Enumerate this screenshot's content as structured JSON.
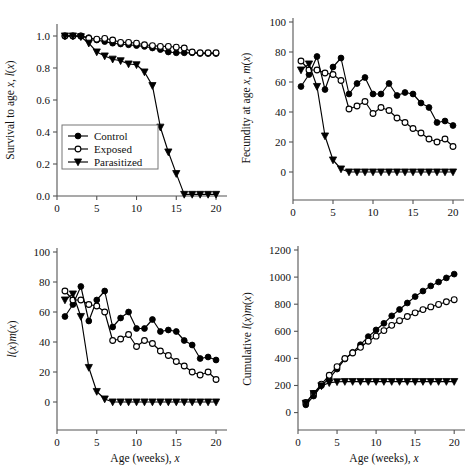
{
  "figure": {
    "background": "#ffffff",
    "line_color": "#000000",
    "marker_fill_control": "#000000",
    "marker_fill_exposed": "#ffffff",
    "marker_fill_parasitized": "#000000",
    "axis_color": "#555555"
  },
  "legend": {
    "position": "top-left panel, lower-left inside axes",
    "entries": [
      {
        "label": "Control",
        "marker": "filled-circle"
      },
      {
        "label": "Exposed",
        "marker": "open-circle"
      },
      {
        "label": "Parasitized",
        "marker": "filled-triangle-down"
      }
    ]
  },
  "chart_data": [
    {
      "id": "panel-survival",
      "type": "line",
      "title": "",
      "xlabel": "",
      "ylabel": "Survival to age x, l(x)",
      "xlim": [
        0,
        21
      ],
      "ylim": [
        0,
        1.05
      ],
      "xticks": [
        0,
        5,
        10,
        15,
        20
      ],
      "yticks": [
        0.0,
        0.2,
        0.4,
        0.6,
        0.8,
        1.0
      ],
      "ytick_labels": [
        "0.0",
        "0.2",
        "0.4",
        "0.6",
        "0.8",
        "1.0"
      ],
      "xtick_labels": [
        "0",
        "5",
        "10",
        "15",
        "20"
      ],
      "grid": false,
      "legend_shown": true,
      "x": [
        1,
        2,
        3,
        4,
        5,
        6,
        7,
        8,
        9,
        10,
        11,
        12,
        13,
        14,
        15,
        16,
        17,
        18,
        19,
        20
      ],
      "series": [
        {
          "name": "Control",
          "marker": "filled-circle",
          "values": [
            1.0,
            1.0,
            1.0,
            0.99,
            0.975,
            0.965,
            0.955,
            0.95,
            0.945,
            0.94,
            0.935,
            0.925,
            0.915,
            0.9,
            0.895,
            0.895,
            0.895,
            0.89,
            0.89,
            0.89
          ]
        },
        {
          "name": "Exposed",
          "marker": "open-circle",
          "values": [
            1.0,
            1.0,
            1.0,
            0.985,
            0.98,
            0.985,
            0.975,
            0.96,
            0.96,
            0.955,
            0.945,
            0.94,
            0.935,
            0.935,
            0.93,
            0.925,
            0.9,
            0.895,
            0.895,
            0.895
          ]
        },
        {
          "name": "Parasitized",
          "marker": "filled-triangle-down",
          "values": [
            1.0,
            1.0,
            0.995,
            0.955,
            0.9,
            0.875,
            0.855,
            0.845,
            0.825,
            0.82,
            0.775,
            0.69,
            0.43,
            0.275,
            0.14,
            0.01,
            0.01,
            0.01,
            0.01,
            0.01
          ]
        }
      ]
    },
    {
      "id": "panel-fecundity",
      "type": "line",
      "title": "",
      "xlabel": "",
      "ylabel": "Fecundity at age x, m(x)",
      "xlim": [
        0,
        21
      ],
      "ylim": [
        -8,
        100
      ],
      "xticks": [
        0,
        5,
        10,
        15,
        20
      ],
      "yticks": [
        0,
        20,
        40,
        60,
        80,
        100
      ],
      "ytick_labels": [
        "0",
        "20",
        "40",
        "60",
        "80",
        "100"
      ],
      "xtick_labels": [
        "0",
        "5",
        "10",
        "15",
        "20"
      ],
      "grid": false,
      "legend_shown": false,
      "x": [
        1,
        2,
        3,
        4,
        5,
        6,
        7,
        8,
        9,
        10,
        11,
        12,
        13,
        14,
        15,
        16,
        17,
        18,
        19,
        20
      ],
      "series": [
        {
          "name": "Control",
          "marker": "filled-circle",
          "values": [
            57,
            65,
            77,
            55,
            70,
            76,
            52,
            59,
            63,
            52,
            52,
            59,
            51,
            53,
            52,
            46,
            43,
            33,
            34,
            31
          ]
        },
        {
          "name": "Exposed",
          "marker": "open-circle",
          "values": [
            74,
            68,
            68,
            66,
            65,
            61,
            42,
            44,
            47,
            39,
            43,
            41,
            36,
            33,
            29,
            26,
            22,
            20,
            22,
            17
          ]
        },
        {
          "name": "Parasitized",
          "marker": "filled-triangle-down",
          "values": [
            68,
            72,
            57,
            24,
            8,
            2,
            0,
            0,
            0,
            0,
            0,
            0,
            0,
            0,
            0,
            0,
            0,
            0,
            0,
            0
          ]
        }
      ]
    },
    {
      "id": "panel-lxmx",
      "type": "line",
      "title": "",
      "xlabel": "Age (weeks), x",
      "ylabel": "l(x)m(x)",
      "xlim": [
        0,
        21
      ],
      "ylim": [
        -8,
        100
      ],
      "xticks": [
        0,
        5,
        10,
        15,
        20
      ],
      "yticks": [
        0,
        20,
        40,
        60,
        80,
        100
      ],
      "ytick_labels": [
        "0",
        "20",
        "40",
        "60",
        "80",
        "100"
      ],
      "xtick_labels": [
        "0",
        "5",
        "10",
        "15",
        "20"
      ],
      "grid": false,
      "legend_shown": false,
      "x": [
        1,
        2,
        3,
        4,
        5,
        6,
        7,
        8,
        9,
        10,
        11,
        12,
        13,
        14,
        15,
        16,
        17,
        18,
        19,
        20
      ],
      "series": [
        {
          "name": "Control",
          "marker": "filled-circle",
          "values": [
            57,
            65,
            77,
            54,
            68,
            74,
            50,
            56,
            60,
            49,
            49,
            55,
            47,
            48,
            47,
            41,
            38,
            29,
            30,
            28
          ]
        },
        {
          "name": "Exposed",
          "marker": "open-circle",
          "values": [
            74,
            68,
            68,
            65,
            64,
            60,
            41,
            42,
            45,
            37,
            41,
            39,
            34,
            31,
            27,
            24,
            20,
            18,
            20,
            15
          ]
        },
        {
          "name": "Parasitized",
          "marker": "filled-triangle-down",
          "values": [
            68,
            72,
            57,
            23,
            7,
            2,
            0,
            0,
            0,
            0,
            0,
            0,
            0,
            0,
            0,
            0,
            0,
            0,
            0,
            0
          ]
        }
      ]
    },
    {
      "id": "panel-cumulative",
      "type": "line",
      "title": "",
      "xlabel": "Age (weeks), x",
      "ylabel": "Cumulative l(x)m(x)",
      "xlim": [
        0,
        21
      ],
      "ylim": [
        -40,
        1200
      ],
      "xticks": [
        0,
        5,
        10,
        15,
        20
      ],
      "yticks": [
        0,
        200,
        400,
        600,
        800,
        1000,
        1200
      ],
      "ytick_labels": [
        "0",
        "200",
        "400",
        "600",
        "800",
        "1000",
        "1200"
      ],
      "xtick_labels": [
        "0",
        "5",
        "10",
        "15",
        "20"
      ],
      "grid": false,
      "legend_shown": false,
      "x": [
        1,
        2,
        3,
        4,
        5,
        6,
        7,
        8,
        9,
        10,
        11,
        12,
        13,
        14,
        15,
        16,
        17,
        18,
        19,
        20
      ],
      "series": [
        {
          "name": "Control",
          "marker": "filled-circle",
          "values": [
            57,
            122,
            199,
            253,
            321,
            395,
            445,
            501,
            561,
            610,
            659,
            714,
            761,
            809,
            856,
            897,
            935,
            964,
            994,
            1022
          ]
        },
        {
          "name": "Exposed",
          "marker": "open-circle",
          "values": [
            74,
            142,
            210,
            275,
            339,
            399,
            440,
            482,
            527,
            564,
            605,
            644,
            678,
            709,
            736,
            760,
            780,
            798,
            818,
            833
          ]
        },
        {
          "name": "Parasitized",
          "marker": "filled-triangle-down",
          "values": [
            68,
            140,
            197,
            220,
            227,
            229,
            229,
            229,
            229,
            229,
            229,
            229,
            229,
            229,
            229,
            229,
            229,
            229,
            229,
            229
          ]
        }
      ]
    }
  ]
}
